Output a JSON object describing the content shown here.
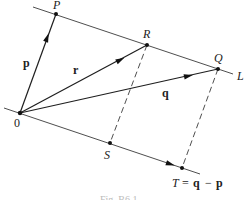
{
  "figure": {
    "caption": "Fig. B6.1",
    "points": {
      "O": {
        "label": "0",
        "x": 20,
        "y": 113
      },
      "P": {
        "label": "P",
        "x": 56,
        "y": 14
      },
      "R": {
        "label": "R",
        "x": 147,
        "y": 45
      },
      "Q": {
        "label": "Q",
        "x": 218,
        "y": 69
      },
      "S": {
        "label": "S",
        "x": 110,
        "y": 143
      },
      "T": {
        "label": "T",
        "x": 182,
        "y": 168
      }
    },
    "lines": {
      "L": {
        "label": "L",
        "through": [
          "P",
          "R",
          "Q"
        ]
      },
      "origin_line": {
        "through": [
          "O",
          "S",
          "T"
        ]
      }
    },
    "vectors": {
      "p": {
        "label": "p",
        "from": "O",
        "to": "P"
      },
      "r": {
        "label": "r",
        "from": "O",
        "to": "R"
      },
      "q": {
        "label": "q",
        "from": "O",
        "to": "Q"
      }
    },
    "dashed_segments": [
      {
        "from": "R",
        "to": "S"
      },
      {
        "from": "Q",
        "to": "T"
      }
    ],
    "annotations": {
      "T_equation_lhs": "T",
      "T_equation_eq": "=",
      "T_equation_q": "q",
      "T_equation_minus": "−",
      "T_equation_p": "p"
    }
  }
}
